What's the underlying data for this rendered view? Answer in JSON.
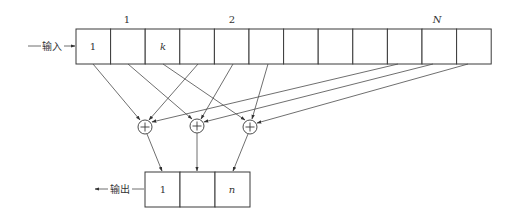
{
  "diagram": {
    "input_label": "输入",
    "output_label": "输出",
    "top_markers": [
      {
        "text": "1",
        "x": 127,
        "italic": false
      },
      {
        "text": "2",
        "x": 232,
        "italic": false
      },
      {
        "text": "N",
        "x": 437,
        "italic": true
      }
    ],
    "input_register": {
      "cell_count": 12,
      "cells": [
        {
          "index": 1,
          "text": "1",
          "italic": false
        },
        {
          "index": 2,
          "text": "",
          "italic": false
        },
        {
          "index": 3,
          "text": "k",
          "italic": true
        },
        {
          "index": 4,
          "text": "",
          "italic": false
        },
        {
          "index": 5,
          "text": "",
          "italic": false
        },
        {
          "index": 6,
          "text": "",
          "italic": false
        },
        {
          "index": 7,
          "text": "",
          "italic": false
        },
        {
          "index": 8,
          "text": "",
          "italic": false
        },
        {
          "index": 9,
          "text": "",
          "italic": false
        },
        {
          "index": 10,
          "text": "",
          "italic": false
        },
        {
          "index": 11,
          "text": "",
          "italic": false
        },
        {
          "index": 12,
          "text": "",
          "italic": false
        }
      ]
    },
    "adders": [
      {
        "symbol": "+",
        "inputs_from_cells": [
          1,
          4,
          10
        ],
        "output_to_cell": 1
      },
      {
        "symbol": "+",
        "inputs_from_cells": [
          2,
          5,
          11
        ],
        "output_to_cell": 2
      },
      {
        "symbol": "+",
        "inputs_from_cells": [
          3,
          6,
          12
        ],
        "output_to_cell": 3
      }
    ],
    "output_register": {
      "cells": [
        {
          "index": 1,
          "text": "1",
          "italic": false
        },
        {
          "index": 2,
          "text": "",
          "italic": false
        },
        {
          "index": 3,
          "text": "n",
          "italic": true
        }
      ]
    }
  }
}
